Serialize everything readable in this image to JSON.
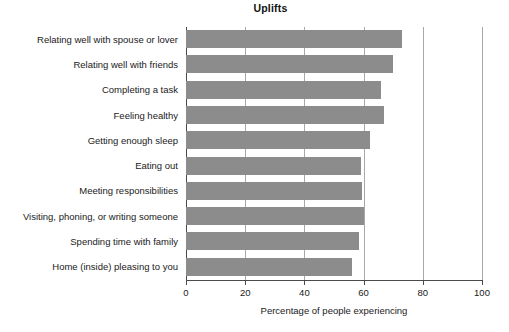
{
  "chart_data": {
    "type": "bar",
    "orientation": "horizontal",
    "title": "Uplifts",
    "xlabel": "Percentage of people experiencing",
    "ylabel": "",
    "xlim": [
      0,
      100
    ],
    "xticks": [
      0,
      20,
      40,
      60,
      80,
      100
    ],
    "xtick_labels": [
      "0",
      "20",
      "40",
      "60",
      "80",
      "100"
    ],
    "grid": true,
    "grid_axis": "x",
    "legend": false,
    "bar_color": "#8c8c8c",
    "axis_color": "#4a4a4a",
    "gridline_color": "#a8a8a8",
    "categories": [
      "Relating well with spouse or lover",
      "Relating well with friends",
      "Completing a task",
      "Feeling healthy",
      "Getting enough sleep",
      "Eating out",
      "Meeting responsibilities",
      "Visiting, phoning, or writing someone",
      "Spending time with family",
      "Home (inside) pleasing to you"
    ],
    "values": [
      73,
      70,
      66,
      67,
      62,
      59,
      59.5,
      60,
      58.5,
      56
    ]
  }
}
